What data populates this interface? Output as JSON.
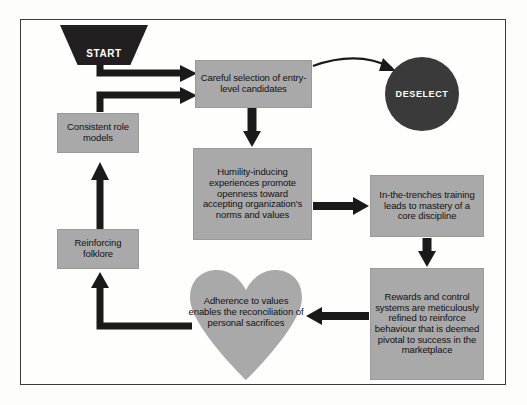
{
  "diagram": {
    "colors": {
      "node_fill": "#a9a9a9",
      "dark_fill": "#231f20",
      "circle_fill": "#3a3a3a",
      "arrow": "#1a1a1a",
      "frame": "#3b3b3b",
      "page": "#fdfdfc",
      "dark_text": "#ffffff",
      "node_text": "#111111"
    },
    "nodes": {
      "start": {
        "label": "START",
        "shape": "trapezoid"
      },
      "deselect": {
        "label": "DESELECT",
        "shape": "circle"
      },
      "careful_selection": {
        "label": "Careful selection of entry-level candidates",
        "shape": "rectangle"
      },
      "humility": {
        "label": "Humility-inducing experiences promote openness toward accepting organization's norms and values",
        "shape": "rectangle"
      },
      "trenches": {
        "label": "In-the-trenches training leads to mastery of a core discipline",
        "shape": "rectangle"
      },
      "rewards": {
        "label": "Rewards and control systems are meticulously refined to reinforce behaviour that is deemed pivotal to success in the marketplace",
        "shape": "rectangle"
      },
      "adherence": {
        "label": "Adherence to values enables the reconciliation of personal sacrifices",
        "shape": "heart"
      },
      "consistent_role_models": {
        "label": "Consistent role models",
        "shape": "rectangle"
      },
      "reinforcing_folklore": {
        "label": "Reinforcing folklore",
        "shape": "rectangle"
      }
    },
    "edges": [
      {
        "from": "start",
        "to": "careful_selection",
        "style": "thick-elbow"
      },
      {
        "from": "consistent_role_models",
        "to": "careful_selection",
        "style": "thick-elbow"
      },
      {
        "from": "careful_selection",
        "to": "deselect",
        "style": "thin-curve"
      },
      {
        "from": "careful_selection",
        "to": "humility",
        "style": "thick-down"
      },
      {
        "from": "humility",
        "to": "trenches",
        "style": "thick-right"
      },
      {
        "from": "trenches",
        "to": "rewards",
        "style": "thick-down"
      },
      {
        "from": "rewards",
        "to": "adherence",
        "style": "thick-left"
      },
      {
        "from": "adherence",
        "to": "reinforcing_folklore",
        "style": "thick-elbow"
      },
      {
        "from": "reinforcing_folklore",
        "to": "consistent_role_models",
        "style": "thick-up"
      }
    ]
  }
}
